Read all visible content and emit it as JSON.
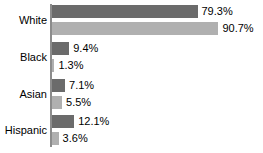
{
  "chart_data": {
    "type": "bar",
    "orientation": "horizontal",
    "title": "",
    "subtitle": "",
    "xlabel": "",
    "ylabel": "",
    "grid": false,
    "legend": "none",
    "xlim": [
      0,
      100
    ],
    "value_suffix": "%",
    "categories": [
      "White",
      "Black",
      "Asian",
      "Hispanic"
    ],
    "series": [
      {
        "name": "Series 1",
        "color": "#6b6b6b",
        "values": [
          79.3,
          9.4,
          7.1,
          12.1
        ],
        "labels": [
          "79.3%",
          "9.4%",
          "7.1%",
          "12.1%"
        ]
      },
      {
        "name": "Series 2",
        "color": "#b0b0b0",
        "values": [
          90.7,
          1.3,
          5.5,
          3.6
        ],
        "labels": [
          "90.7%",
          "1.3%",
          "5.5%",
          "3.6%"
        ]
      }
    ]
  },
  "axis": {
    "line_color": "#8c8c8c"
  },
  "groups": [
    {
      "label": "White",
      "bars": [
        {
          "label": "79.3%",
          "value": 79.3,
          "series": 0
        },
        {
          "label": "90.7%",
          "value": 90.7,
          "series": 1
        }
      ]
    },
    {
      "label": "Black",
      "bars": [
        {
          "label": "9.4%",
          "value": 9.4,
          "series": 0
        },
        {
          "label": "1.3%",
          "value": 1.3,
          "series": 1
        }
      ]
    },
    {
      "label": "Asian",
      "bars": [
        {
          "label": "7.1%",
          "value": 7.1,
          "series": 0
        },
        {
          "label": "5.5%",
          "value": 5.5,
          "series": 1
        }
      ]
    },
    {
      "label": "Hispanic",
      "bars": [
        {
          "label": "12.1%",
          "value": 12.1,
          "series": 0
        },
        {
          "label": "3.6%",
          "value": 3.6,
          "series": 1
        }
      ]
    }
  ]
}
